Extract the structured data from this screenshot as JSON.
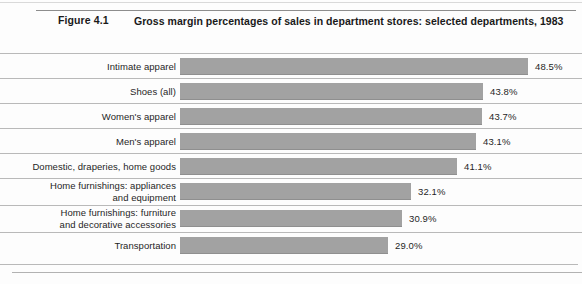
{
  "figure": {
    "number_label": "Figure 4.1",
    "title": "Gross margin percentages of sales in department stores: selected departments, 1983",
    "footnote": ""
  },
  "chart_data": {
    "type": "bar",
    "orientation": "horizontal",
    "title": "Gross margin percentages of sales in department stores: selected departments, 1983",
    "xlabel": "",
    "ylabel": "",
    "xlim": [
      0,
      50
    ],
    "grid": false,
    "legend": null,
    "bar_color": "#a2a2a2",
    "value_suffix": "%",
    "categories": [
      "Intimate apparel",
      "Shoes (all)",
      "Women's apparel",
      "Men's apparel",
      "Domestic, draperies, home goods",
      "Home furnishings: appliances and equipment",
      "Home furnishings: furniture and decorative accessories",
      "Transportation"
    ],
    "values": [
      48.5,
      43.8,
      43.7,
      43.1,
      41.1,
      32.1,
      30.9,
      29.0
    ],
    "value_labels": [
      "48.5%",
      "43.8%",
      "43.7%",
      "43.1%",
      "41.1%",
      "32.1%",
      "30.9%",
      "29.0%"
    ],
    "rows": [
      {
        "label_lines": [
          "Intimate apparel"
        ],
        "value": 48.5,
        "value_label": "48.5%",
        "bar_width_px": 348,
        "top_px": 0
      },
      {
        "label_lines": [
          "Shoes (all)"
        ],
        "value": 43.8,
        "value_label": "43.8%",
        "bar_width_px": 303,
        "top_px": 25
      },
      {
        "label_lines": [
          "Women's apparel"
        ],
        "value": 43.7,
        "value_label": "43.7%",
        "bar_width_px": 302,
        "top_px": 50
      },
      {
        "label_lines": [
          "Men's apparel"
        ],
        "value": 43.1,
        "value_label": "43.1%",
        "bar_width_px": 296,
        "top_px": 75
      },
      {
        "label_lines": [
          "Domestic, draperies, home goods"
        ],
        "value": 41.1,
        "value_label": "41.1%",
        "bar_width_px": 277,
        "top_px": 100
      },
      {
        "label_lines": [
          "Home furnishings: appliances",
          "and equipment"
        ],
        "value": 32.1,
        "value_label": "32.1%",
        "bar_width_px": 231,
        "top_px": 125
      },
      {
        "label_lines": [
          "Home furnishings: furniture",
          "and decorative accessories"
        ],
        "value": 30.9,
        "value_label": "30.9%",
        "bar_width_px": 222,
        "top_px": 152
      },
      {
        "label_lines": [
          "Transportation"
        ],
        "value": 29.0,
        "value_label": "29.0%",
        "bar_width_px": 208,
        "top_px": 179
      }
    ]
  }
}
